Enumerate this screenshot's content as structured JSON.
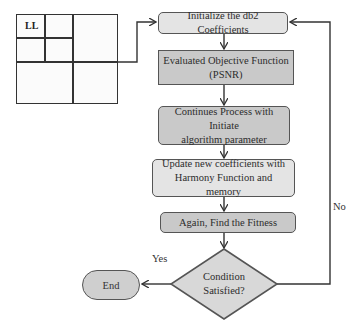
{
  "grid": {
    "quadrant_label": "LL"
  },
  "flowchart": {
    "steps": [
      {
        "id": "init",
        "lines": [
          "Initialize the db2 Coefficients"
        ]
      },
      {
        "id": "evaluate",
        "lines": [
          "Evaluated Objective Function",
          "(PSNR)"
        ]
      },
      {
        "id": "continue",
        "lines": [
          "Continues Process with Initiate",
          "algorithm parameter"
        ]
      },
      {
        "id": "update",
        "lines": [
          "Update new coefficients with",
          "Harmony Function and memory"
        ]
      },
      {
        "id": "fitness",
        "lines": [
          "Again, Find the Fitness"
        ]
      }
    ],
    "decision": {
      "lines": [
        "Condition",
        "Satisfied?"
      ]
    },
    "end": {
      "label": "End"
    },
    "edge_labels": {
      "yes": "Yes",
      "no": "No"
    }
  },
  "colors": {
    "stroke": "#555555",
    "fill_light": "#e4e4e4",
    "fill_dark": "#c9c9c9",
    "line": "#333333"
  }
}
